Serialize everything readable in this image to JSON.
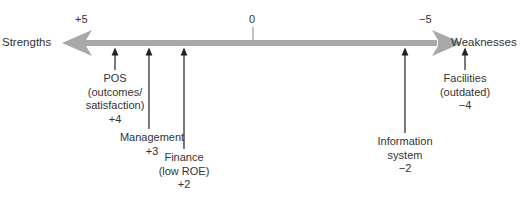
{
  "diagram": {
    "type": "strengths-weaknesses-scale",
    "axis": {
      "left_label": "Strengths",
      "right_label": "Weaknesses",
      "ticks": [
        {
          "label": "+5",
          "x": 124
        },
        {
          "label": "0",
          "x": 253
        },
        {
          "label": "−5",
          "x": 427
        }
      ],
      "colors": {
        "shaft": "#a8a8a8",
        "text": "#333333",
        "pointer": "#222222"
      }
    },
    "factors": [
      {
        "lines": [
          "POS",
          "(outcomes/",
          "satisfaction)",
          "+4"
        ],
        "score": "+4",
        "x": 115
      },
      {
        "lines": [
          "Management",
          "+3"
        ],
        "score": "+3",
        "x": 149
      },
      {
        "lines": [
          "Finance",
          "(low ROE)",
          "+2"
        ],
        "score": "+2",
        "x": 184
      },
      {
        "lines": [
          "Information",
          "system",
          "−2"
        ],
        "score": "−2",
        "x": 405
      },
      {
        "lines": [
          "Facilities",
          "(outdated)",
          "−4"
        ],
        "score": "−4",
        "x": 465
      }
    ]
  }
}
